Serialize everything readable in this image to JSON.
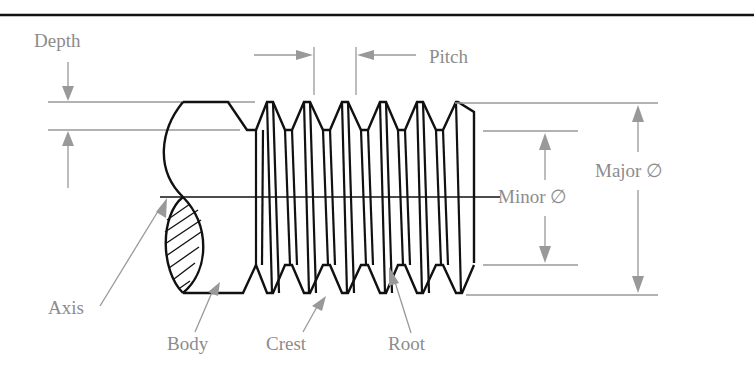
{
  "figure": {
    "colors": {
      "object_lines": "#111111",
      "dimension_lines": "#999999",
      "labels": "#8c8c8c",
      "background": "#ffffff"
    }
  },
  "labels": {
    "depth": "Depth",
    "pitch": "Pitch",
    "minor_diameter": "Minor ∅",
    "major_diameter": "Major ∅",
    "axis": "Axis",
    "body": "Body",
    "crest": "Crest",
    "root": "Root"
  },
  "thread": {
    "thread_count": 6,
    "section_hatch": true
  }
}
